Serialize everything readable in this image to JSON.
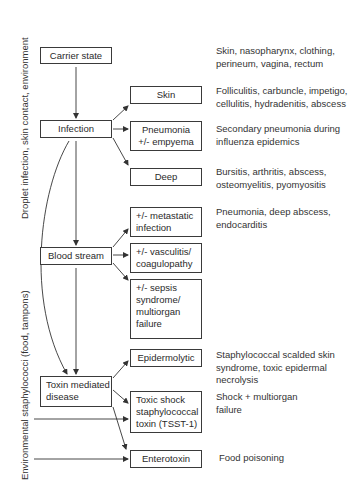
{
  "side_labels": {
    "top": "Droplet infection, skin contact, environment",
    "bottom": "Environmental staphylococci (food, tampons)"
  },
  "left_nodes": {
    "carrier": "Carrier state",
    "infection": "Infection",
    "blood": "Blood stream",
    "toxin": [
      "Toxin mediated",
      "disease"
    ]
  },
  "middle_nodes": {
    "skin": "Skin",
    "pneumonia": [
      "Pneumonia",
      "+/- empyema"
    ],
    "deep": "Deep",
    "metastatic": [
      "+/- metastatic",
      "infection"
    ],
    "vasculitis": [
      "+/- vasculitis/",
      "coagulopathy"
    ],
    "sepsis": [
      "+/- sepsis",
      "syndrome/",
      "multiorgan",
      "failure"
    ],
    "epidermolytic": "Epidermolytic",
    "toxic_shock": [
      "Toxic shock",
      "staphylococcal",
      "toxin (TSST-1)"
    ],
    "enterotoxin": "Enterotoxin"
  },
  "descriptions": {
    "carrier": [
      "Skin, nasopharynx, clothing,",
      "perineum, vagina, rectum"
    ],
    "skin": [
      "Folliculitis, carbuncle, impetigo,",
      "cellulitis, hydradenitis, abscess"
    ],
    "pneumonia": [
      "Secondary pneumonia during",
      "influenza epidemics"
    ],
    "deep": [
      "Bursitis, arthritis, abscess,",
      "osteomyelitis, pyomyositis"
    ],
    "metastatic": [
      "Pneumonia, deep abscess,",
      "endocarditis"
    ],
    "epidermolytic": [
      "Staphylococcal scalded skin",
      "syndrome, toxic epidermal",
      "necrolysis"
    ],
    "toxic_shock": [
      "Shock + multiorgan",
      "failure"
    ],
    "enterotoxin": [
      "Food poisoning"
    ]
  },
  "colors": {
    "line": "#333333",
    "text": "#2a2a2a"
  }
}
